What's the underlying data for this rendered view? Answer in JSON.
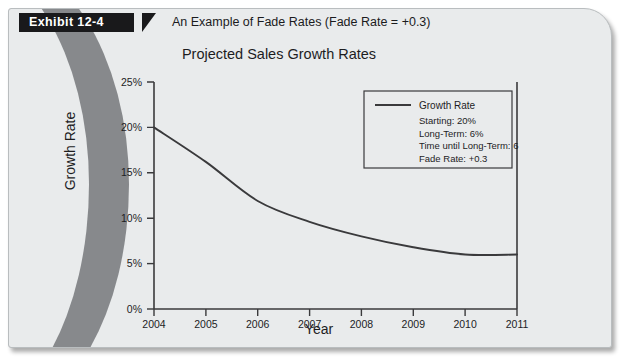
{
  "exhibit": {
    "tag": "Exhibit 12-4",
    "caption": "An Example of Fade Rates (Fade Rate = +0.3)"
  },
  "chart_data": {
    "type": "line",
    "title": "Projected Sales Growth Rates",
    "xlabel": "Year",
    "ylabel": "Growth Rate",
    "x": [
      "2004",
      "2005",
      "2006",
      "2007",
      "2008",
      "2009",
      "2010",
      "2011"
    ],
    "categories": [
      "2004",
      "2005",
      "2006",
      "2007",
      "2008",
      "2009",
      "2010",
      "2011"
    ],
    "series": [
      {
        "name": "Growth Rate",
        "values": [
          20.0,
          16.2,
          11.9,
          9.6,
          8.0,
          6.8,
          6.0,
          6.0
        ]
      }
    ],
    "values": [
      20.0,
      16.2,
      11.9,
      9.6,
      8.0,
      6.8,
      6.0,
      6.0
    ],
    "ylim": [
      0,
      25
    ],
    "ytick_labels": [
      "0%",
      "5%",
      "10%",
      "15%",
      "20%",
      "25%"
    ],
    "ytick_values": [
      0,
      5,
      10,
      15,
      20,
      25
    ],
    "grid": false,
    "legend_position": "upper right",
    "line_color": "#3a3a3c"
  },
  "legend": {
    "series_label": "Growth Rate",
    "annotations": [
      "Starting:  20%",
      "Long-Term:  6%",
      "Time until Long-Term: 6",
      "Fade Rate:  +0.3"
    ]
  }
}
